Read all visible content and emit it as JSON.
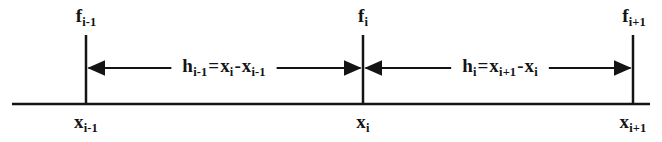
{
  "figure": {
    "name": "grid-spacing-diagram",
    "background_color": "#ffffff",
    "ink_color": "#141414",
    "width": 662,
    "height": 142,
    "axis": {
      "name": "baseline-axis",
      "x_start": 12,
      "x_end": 650,
      "y": 104
    }
  },
  "nodes": [
    {
      "id": "i-minus-1",
      "x": 86,
      "tick_top": 35,
      "f_label": {
        "base": "f",
        "sub": "i-1"
      },
      "x_label": {
        "base": "x",
        "sub": "i-1"
      }
    },
    {
      "id": "i",
      "x": 363,
      "tick_top": 35,
      "f_label": {
        "base": "f",
        "sub": "i"
      },
      "x_label": {
        "base": "x",
        "sub": "i"
      }
    },
    {
      "id": "i-plus-1",
      "x": 633,
      "tick_top": 35,
      "f_label": {
        "base": "f",
        "sub": "i+1"
      },
      "x_label": {
        "base": "x",
        "sub": "i+1"
      }
    }
  ],
  "intervals": [
    {
      "id": "h-i-minus-1",
      "from_x": 86,
      "to_x": 363,
      "arrow_y": 68,
      "label_center_x": 224,
      "equation": {
        "lhs": {
          "base": "h",
          "sub": "i-1"
        },
        "equals": "=",
        "term1": {
          "base": "x",
          "sub": "i"
        },
        "operator": "-",
        "term2": {
          "base": "x",
          "sub": "i-1"
        }
      },
      "equation_text": "h_i-1 = x_i - x_i-1"
    },
    {
      "id": "h-i",
      "from_x": 363,
      "to_x": 633,
      "arrow_y": 68,
      "label_center_x": 500,
      "equation": {
        "lhs": {
          "base": "h",
          "sub": "i"
        },
        "equals": "=",
        "term1": {
          "base": "x",
          "sub": "i+1"
        },
        "operator": "-",
        "term2": {
          "base": "x",
          "sub": "i"
        }
      },
      "equation_text": "h_i = x_i+1 - x_i"
    }
  ]
}
